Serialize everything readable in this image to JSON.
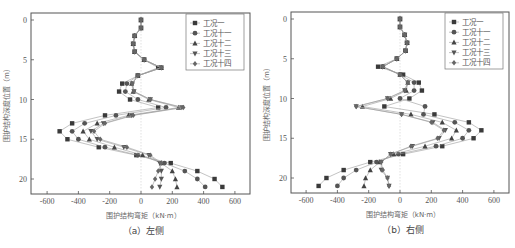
{
  "chart_data": [
    {
      "type": "scatter",
      "id": "left",
      "caption": "（a）左侧",
      "xlabel": "围护结构弯矩（kN·m）",
      "ylabel": "围护结构深度位置（m）",
      "xlim": [
        -700,
        700
      ],
      "ylim": [
        22,
        -1
      ],
      "xticks": [
        -600,
        -400,
        -200,
        0,
        200,
        400,
        600
      ],
      "yticks": [
        0,
        5,
        10,
        15,
        20
      ],
      "grid": false,
      "legend_position": "top-right",
      "depth": [
        0,
        1,
        2,
        3,
        4,
        5,
        6,
        7,
        8,
        9,
        10,
        11,
        12,
        13,
        14,
        15,
        16,
        17,
        18,
        19,
        20,
        21
      ],
      "series": [
        {
          "name": "工况一",
          "marker": "square",
          "values": [
            0,
            0,
            -40,
            -50,
            -40,
            20,
            110,
            -20,
            -120,
            -140,
            -70,
            110,
            -230,
            -440,
            -520,
            -470,
            -270,
            -30,
            190,
            360,
            470,
            520
          ]
        },
        {
          "name": "工况十一",
          "marker": "circle",
          "values": [
            0,
            0,
            -40,
            -50,
            -40,
            20,
            130,
            -20,
            -90,
            -100,
            -20,
            160,
            -160,
            -360,
            -440,
            -400,
            -230,
            -20,
            150,
            280,
            360,
            410
          ]
        },
        {
          "name": "工况十二",
          "marker": "triangle-up",
          "values": [
            0,
            0,
            -40,
            -50,
            -40,
            20,
            130,
            -20,
            -60,
            -50,
            50,
            240,
            -80,
            -280,
            -370,
            -330,
            -170,
            10,
            130,
            200,
            220,
            230
          ]
        },
        {
          "name": "工况十三",
          "marker": "triangle-down",
          "values": [
            0,
            0,
            -40,
            -50,
            -40,
            20,
            130,
            -20,
            -55,
            -45,
            60,
            260,
            -60,
            -240,
            -320,
            -280,
            -110,
            50,
            120,
            130,
            130,
            120
          ]
        },
        {
          "name": "工况十四",
          "marker": "diamond",
          "values": [
            0,
            0,
            -40,
            -50,
            -40,
            20,
            130,
            -20,
            -55,
            -45,
            60,
            270,
            -50,
            -230,
            -300,
            -260,
            -90,
            60,
            130,
            110,
            90,
            70
          ]
        }
      ]
    },
    {
      "type": "scatter",
      "id": "right",
      "caption": "（b）右侧",
      "xlabel": "围护结构弯矩（kN·m）",
      "ylabel": "围护结构深度位置（m）",
      "xlim": [
        -700,
        700
      ],
      "ylim": [
        22,
        -1
      ],
      "xticks": [
        -600,
        -400,
        -200,
        0,
        200,
        400,
        600
      ],
      "yticks": [
        0,
        5,
        10,
        15,
        20
      ],
      "grid": false,
      "legend_position": "top-right",
      "depth": [
        0,
        1,
        2,
        3,
        4,
        5,
        6,
        7,
        8,
        9,
        10,
        11,
        12,
        13,
        14,
        15,
        16,
        17,
        18,
        19,
        20,
        21
      ],
      "series": [
        {
          "name": "工况一",
          "marker": "square",
          "values": [
            0,
            0,
            30,
            45,
            35,
            -20,
            -140,
            20,
            120,
            140,
            60,
            -100,
            220,
            440,
            520,
            470,
            270,
            20,
            -190,
            -360,
            -470,
            -520
          ]
        },
        {
          "name": "工况十一",
          "marker": "circle",
          "values": [
            0,
            0,
            30,
            45,
            35,
            -20,
            -110,
            0,
            90,
            90,
            0,
            160,
            150,
            350,
            440,
            400,
            230,
            -10,
            -150,
            -280,
            -360,
            -400
          ]
        },
        {
          "name": "工况十二",
          "marker": "triangle-up",
          "values": [
            0,
            0,
            30,
            45,
            35,
            -20,
            -110,
            0,
            50,
            40,
            -60,
            -240,
            70,
            270,
            360,
            330,
            160,
            -40,
            -130,
            -190,
            -220,
            -230
          ]
        },
        {
          "name": "工况十三",
          "marker": "triangle-down",
          "values": [
            0,
            0,
            30,
            45,
            35,
            -20,
            -110,
            0,
            50,
            30,
            -80,
            -280,
            10,
            210,
            290,
            250,
            80,
            -60,
            -120,
            -120,
            -80,
            -70
          ]
        },
        {
          "name": "工况十四",
          "marker": "diamond",
          "values": [
            0,
            0,
            30,
            45,
            35,
            -20,
            -110,
            0,
            50,
            30,
            -80,
            -280,
            10,
            200,
            280,
            240,
            70,
            -60,
            -120,
            -110,
            -80,
            -70
          ]
        }
      ]
    }
  ],
  "colors": {
    "marker": "#3a3a3a",
    "line": "#9a9a9a",
    "frame": "#555555",
    "zero_line": "#cccccc"
  }
}
